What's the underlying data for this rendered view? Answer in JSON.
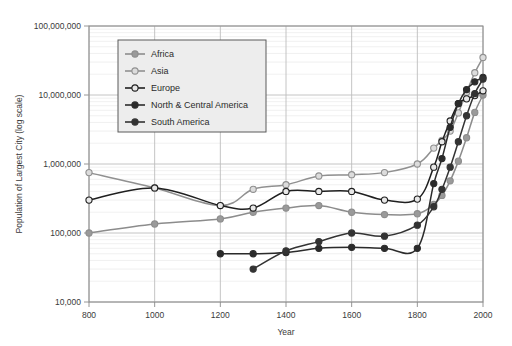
{
  "chart_data": {
    "type": "line",
    "title": "",
    "xlabel": "Year",
    "ylabel": "Population of Largest City (log scale)",
    "yscale": "log",
    "xlim": [
      800,
      2000
    ],
    "ylim": [
      10000,
      100000000
    ],
    "grid": true,
    "minor_grid": true,
    "legend_position": "upper-left-inside",
    "xticks": [
      800,
      1000,
      1200,
      1400,
      1600,
      1800,
      2000
    ],
    "xtick_labels": [
      "800",
      "1000",
      "1200",
      "1400",
      "1600",
      "1800",
      "2000"
    ],
    "yticks": [
      10000,
      100000,
      1000000,
      10000000,
      100000000
    ],
    "ytick_labels": [
      "10,000",
      "100,000",
      "1,000,000",
      "10,000,000",
      "100,000,000"
    ],
    "series": [
      {
        "name": "Africa",
        "color": "#8c8c8c",
        "marker": "open-circle",
        "marker_fill": "#9a9a9a",
        "points": [
          {
            "x": 800,
            "y": 100000
          },
          {
            "x": 1000,
            "y": 135000
          },
          {
            "x": 1200,
            "y": 160000
          },
          {
            "x": 1300,
            "y": 200000
          },
          {
            "x": 1400,
            "y": 230000
          },
          {
            "x": 1500,
            "y": 250000
          },
          {
            "x": 1600,
            "y": 200000
          },
          {
            "x": 1700,
            "y": 185000
          },
          {
            "x": 1800,
            "y": 190000
          },
          {
            "x": 1850,
            "y": 260000
          },
          {
            "x": 1875,
            "y": 350000
          },
          {
            "x": 1900,
            "y": 570000
          },
          {
            "x": 1925,
            "y": 1100000
          },
          {
            "x": 1950,
            "y": 2400000
          },
          {
            "x": 1975,
            "y": 5600000
          },
          {
            "x": 2000,
            "y": 10000000
          }
        ]
      },
      {
        "name": "Asia",
        "color": "#909090",
        "marker": "open-circle",
        "marker_fill": "#dcdcdc",
        "points": [
          {
            "x": 800,
            "y": 750000
          },
          {
            "x": 1000,
            "y": 450000
          },
          {
            "x": 1200,
            "y": 250000
          },
          {
            "x": 1300,
            "y": 430000
          },
          {
            "x": 1400,
            "y": 500000
          },
          {
            "x": 1500,
            "y": 670000
          },
          {
            "x": 1600,
            "y": 700000
          },
          {
            "x": 1700,
            "y": 750000
          },
          {
            "x": 1800,
            "y": 1000000
          },
          {
            "x": 1850,
            "y": 1700000
          },
          {
            "x": 1875,
            "y": 2200000
          },
          {
            "x": 1900,
            "y": 3000000
          },
          {
            "x": 1925,
            "y": 5500000
          },
          {
            "x": 1950,
            "y": 11000000
          },
          {
            "x": 1975,
            "y": 21000000
          },
          {
            "x": 2000,
            "y": 35000000
          }
        ]
      },
      {
        "name": "Europe",
        "color": "#1f1f1f",
        "marker": "open-circle",
        "marker_fill": "#e8e8e8",
        "points": [
          {
            "x": 800,
            "y": 300000
          },
          {
            "x": 1000,
            "y": 450000
          },
          {
            "x": 1200,
            "y": 250000
          },
          {
            "x": 1300,
            "y": 230000
          },
          {
            "x": 1400,
            "y": 400000
          },
          {
            "x": 1500,
            "y": 400000
          },
          {
            "x": 1600,
            "y": 400000
          },
          {
            "x": 1700,
            "y": 300000
          },
          {
            "x": 1800,
            "y": 310000
          },
          {
            "x": 1850,
            "y": 900000
          },
          {
            "x": 1875,
            "y": 2100000
          },
          {
            "x": 1900,
            "y": 4200000
          },
          {
            "x": 1925,
            "y": 7500000
          },
          {
            "x": 1950,
            "y": 8800000
          },
          {
            "x": 1975,
            "y": 9800000
          },
          {
            "x": 2000,
            "y": 11500000
          }
        ]
      },
      {
        "name": "North & Central America",
        "color": "#2b2b2b",
        "marker": "filled-circle",
        "marker_fill": "#2b2b2b",
        "points": [
          {
            "x": 1200,
            "y": 50000
          },
          {
            "x": 1300,
            "y": 50000
          },
          {
            "x": 1400,
            "y": 52000
          },
          {
            "x": 1500,
            "y": 60000
          },
          {
            "x": 1600,
            "y": 62000
          },
          {
            "x": 1700,
            "y": 60000
          },
          {
            "x": 1800,
            "y": 60000
          },
          {
            "x": 1850,
            "y": 520000
          },
          {
            "x": 1875,
            "y": 1200000
          },
          {
            "x": 1900,
            "y": 3400000
          },
          {
            "x": 1925,
            "y": 7500000
          },
          {
            "x": 1950,
            "y": 12000000
          },
          {
            "x": 1975,
            "y": 15500000
          },
          {
            "x": 2000,
            "y": 18000000
          }
        ]
      },
      {
        "name": "South America",
        "color": "#333333",
        "marker": "filled-circle",
        "marker_fill": "#333333",
        "points": [
          {
            "x": 1300,
            "y": 30000
          },
          {
            "x": 1400,
            "y": 55000
          },
          {
            "x": 1500,
            "y": 75000
          },
          {
            "x": 1600,
            "y": 100000
          },
          {
            "x": 1700,
            "y": 90000
          },
          {
            "x": 1800,
            "y": 130000
          },
          {
            "x": 1850,
            "y": 240000
          },
          {
            "x": 1875,
            "y": 430000
          },
          {
            "x": 1900,
            "y": 900000
          },
          {
            "x": 1925,
            "y": 2100000
          },
          {
            "x": 1950,
            "y": 5000000
          },
          {
            "x": 1975,
            "y": 10500000
          },
          {
            "x": 2000,
            "y": 17000000
          }
        ]
      }
    ]
  },
  "legend": {
    "items": [
      {
        "label": "Africa"
      },
      {
        "label": "Asia"
      },
      {
        "label": "Europe"
      },
      {
        "label": "North & Central America"
      },
      {
        "label": "South America"
      }
    ]
  },
  "colors": {
    "plot_border": "#8a8a8a",
    "major_grid": "#bdbdbd",
    "minor_grid": "#e6e6e6",
    "legend_bg": "#ededed",
    "legend_border": "#5a5a5a",
    "background": "#ffffff"
  }
}
